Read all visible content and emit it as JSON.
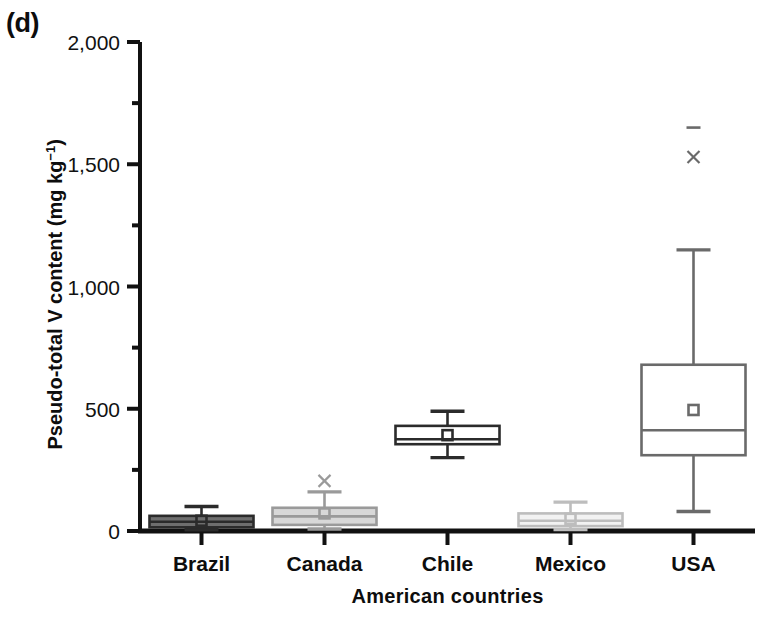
{
  "figure": {
    "panel_label": "(d)",
    "y_axis_title_main": "Pseudo-total V content (mg kg",
    "y_axis_title_sup": "−1",
    "y_axis_title_tail": ")",
    "x_axis_title": "American countries",
    "accent_color": "#0d0d0d",
    "background_color": "#ffffff"
  },
  "chart_data": {
    "type": "box",
    "title": "(d)",
    "xlabel": "American countries",
    "ylabel": "Pseudo-total V content (mg kg−1)",
    "categories": [
      "Brazil",
      "Canada",
      "Chile",
      "Mexico",
      "USA"
    ],
    "ylim": [
      0,
      2000
    ],
    "ytick_values": [
      0,
      500,
      1000,
      1500,
      2000
    ],
    "ytick_labels": [
      "0",
      "500",
      "1,000",
      "1,500",
      "2,000"
    ],
    "yminor_tick_values": [
      250,
      750,
      1250,
      1750
    ],
    "grid": false,
    "legend": null,
    "boxes": [
      {
        "name": "Brazil",
        "fill": "#6e6e6e",
        "stroke": "#2b2b2b",
        "whisker_low": 5,
        "q1": 15,
        "median": 38,
        "mean": 42,
        "q3": 62,
        "whisker_high": 100,
        "outliers": []
      },
      {
        "name": "Canada",
        "fill": "#d8d8d8",
        "stroke": "#9a9a9a",
        "whisker_low": 8,
        "q1": 25,
        "median": 60,
        "mean": 72,
        "q3": 95,
        "whisker_high": 160,
        "outliers": [
          205
        ]
      },
      {
        "name": "Chile",
        "fill": "#ffffff",
        "stroke": "#2b2b2b",
        "whisker_low": 300,
        "q1": 355,
        "median": 375,
        "mean": 392,
        "q3": 430,
        "whisker_high": 490,
        "outliers": []
      },
      {
        "name": "Mexico",
        "fill": "#f2f2f2",
        "stroke": "#bdbdbd",
        "whisker_low": 6,
        "q1": 20,
        "median": 42,
        "mean": 50,
        "q3": 72,
        "whisker_high": 118,
        "outliers": []
      },
      {
        "name": "USA",
        "fill": "#ffffff",
        "stroke": "#6a6a6a",
        "whisker_low": 80,
        "q1": 310,
        "median": 412,
        "mean": 495,
        "q3": 680,
        "whisker_high": 1150,
        "outliers": [
          1530,
          1650
        ]
      }
    ]
  }
}
